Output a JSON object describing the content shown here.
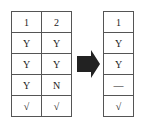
{
  "left_table": {
    "rows": [
      [
        "1",
        "2"
      ],
      [
        "Y",
        "Y"
      ],
      [
        "Y",
        "Y"
      ],
      [
        "Y",
        "N"
      ],
      [
        "√",
        "√"
      ]
    ]
  },
  "arrow": {
    "icon": "right-arrow-icon",
    "color": "#222222"
  },
  "right_table": {
    "rows": [
      [
        "1"
      ],
      [
        "Y"
      ],
      [
        "Y"
      ],
      [
        "—"
      ],
      [
        "√"
      ]
    ]
  }
}
